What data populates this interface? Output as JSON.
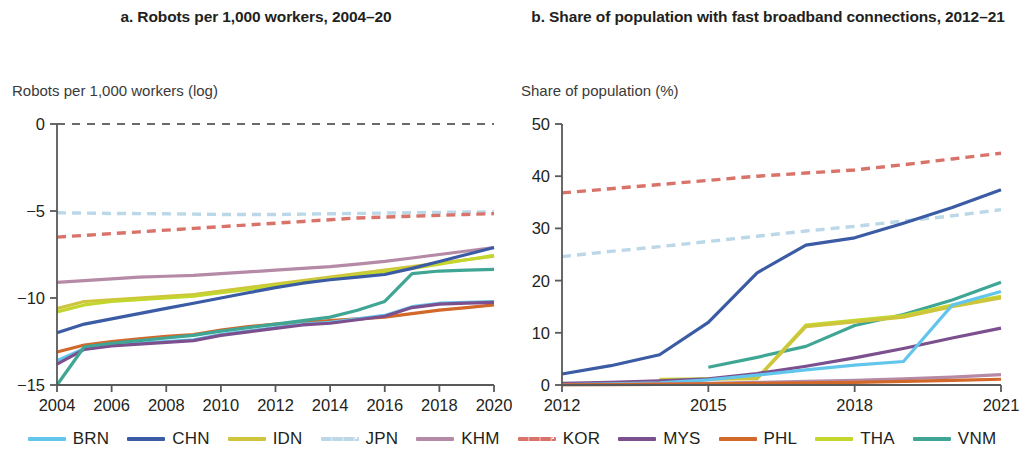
{
  "panels": [
    {
      "id": "a",
      "title": "a. Robots per 1,000 workers, 2004–20",
      "axis_label": "Robots per 1,000 workers (log)"
    },
    {
      "id": "b",
      "title": "b. Share of population with fast broadband connections, 2012–21",
      "axis_label": "Share of population (%)"
    }
  ],
  "legend": {
    "items": [
      {
        "code": "BRN",
        "color": "#62c6ec",
        "dashed": false
      },
      {
        "code": "CHN",
        "color": "#3b5ba5",
        "dashed": false
      },
      {
        "code": "IDN",
        "color": "#cfc53c",
        "dashed": false
      },
      {
        "code": "JPN",
        "color": "#bcd8e8",
        "dashed": true
      },
      {
        "code": "KHM",
        "color": "#b58aa6",
        "dashed": false
      },
      {
        "code": "KOR",
        "color": "#d9736a",
        "dashed": true
      },
      {
        "code": "MYS",
        "color": "#7c4f8e",
        "dashed": false
      },
      {
        "code": "PHL",
        "color": "#d2682a",
        "dashed": false
      },
      {
        "code": "THA",
        "color": "#c3d62e",
        "dashed": false
      },
      {
        "code": "VNM",
        "color": "#3fa695",
        "dashed": false
      }
    ]
  },
  "chart_data": [
    {
      "type": "line",
      "panel": "a",
      "title": "a. Robots per 1,000 workers, 2004–20",
      "xlabel": "",
      "ylabel": "Robots per 1,000 workers (log)",
      "xlim": [
        2004,
        2020
      ],
      "ylim": [
        -15,
        0
      ],
      "ytick_values": [
        0,
        -5,
        -10,
        -15
      ],
      "ytick_labels": [
        "0",
        "−5",
        "−10",
        "−15"
      ],
      "xtick_values": [
        2004,
        2006,
        2008,
        2010,
        2012,
        2014,
        2016,
        2018,
        2020
      ],
      "xtick_labels": [
        "2004",
        "2006",
        "2008",
        "2010",
        "2012",
        "2014",
        "2016",
        "2018",
        "2020"
      ],
      "grid": false,
      "zero_reference_dashed": true,
      "legend_position": "bottom",
      "x": [
        2004,
        2005,
        2006,
        2007,
        2008,
        2009,
        2010,
        2011,
        2012,
        2013,
        2014,
        2015,
        2016,
        2017,
        2018,
        2019,
        2020
      ],
      "series": [
        {
          "name": "JPN",
          "color": "#bcd8e8",
          "dashed": true,
          "values": [
            -5.1,
            -5.12,
            -5.14,
            -5.15,
            -5.16,
            -5.18,
            -5.2,
            -5.2,
            -5.2,
            -5.18,
            -5.16,
            -5.14,
            -5.12,
            -5.1,
            -5.08,
            -5.06,
            -5.05
          ]
        },
        {
          "name": "KOR",
          "color": "#d9736a",
          "dashed": true,
          "values": [
            -6.5,
            -6.4,
            -6.3,
            -6.2,
            -6.1,
            -6.0,
            -5.9,
            -5.8,
            -5.7,
            -5.6,
            -5.5,
            -5.4,
            -5.35,
            -5.3,
            -5.25,
            -5.2,
            -5.15
          ]
        },
        {
          "name": "KHM",
          "color": "#b58aa6",
          "dashed": false,
          "values": [
            -9.1,
            -9.0,
            -8.9,
            -8.8,
            -8.75,
            -8.7,
            -8.6,
            -8.5,
            -8.4,
            -8.3,
            -8.2,
            -8.05,
            -7.9,
            -7.7,
            -7.5,
            -7.3,
            -7.1
          ]
        },
        {
          "name": "IDN",
          "color": "#cfc53c",
          "dashed": false,
          "values": [
            -10.6,
            -10.2,
            -10.1,
            -10.0,
            -9.9,
            -9.8,
            -9.6,
            -9.4,
            -9.2,
            -9.0,
            -8.8,
            -8.6,
            -8.4,
            -8.2,
            -8.0,
            -7.8,
            -7.6
          ]
        },
        {
          "name": "THA",
          "color": "#c3d62e",
          "dashed": false,
          "values": [
            -10.8,
            -10.4,
            -10.2,
            -10.1,
            -10.0,
            -9.9,
            -9.7,
            -9.5,
            -9.3,
            -9.1,
            -8.9,
            -8.7,
            -8.5,
            -8.3,
            -8.05,
            -7.8,
            -7.55
          ]
        },
        {
          "name": "CHN",
          "color": "#3b5ba5",
          "dashed": false,
          "values": [
            -12.0,
            -11.5,
            -11.2,
            -10.9,
            -10.6,
            -10.3,
            -10.0,
            -9.7,
            -9.4,
            -9.15,
            -8.95,
            -8.8,
            -8.65,
            -8.3,
            -7.9,
            -7.5,
            -7.1
          ]
        },
        {
          "name": "PHL",
          "color": "#d2682a",
          "dashed": false,
          "values": [
            -13.1,
            -12.7,
            -12.5,
            -12.35,
            -12.2,
            -12.1,
            -11.85,
            -11.65,
            -11.5,
            -11.4,
            -11.3,
            -11.2,
            -11.1,
            -10.9,
            -10.7,
            -10.55,
            -10.4
          ]
        },
        {
          "name": "BRN",
          "color": "#62c6ec",
          "dashed": false,
          "values": [
            -13.6,
            -12.9,
            -12.7,
            -12.6,
            -12.5,
            -12.4,
            -12.1,
            -11.9,
            -11.7,
            -11.5,
            -11.4,
            -11.2,
            -11.0,
            -10.5,
            -10.3,
            -10.25,
            -10.2
          ]
        },
        {
          "name": "MYS",
          "color": "#7c4f8e",
          "dashed": false,
          "values": [
            -13.8,
            -12.95,
            -12.75,
            -12.65,
            -12.55,
            -12.45,
            -12.15,
            -11.95,
            -11.75,
            -11.55,
            -11.45,
            -11.25,
            -11.05,
            -10.55,
            -10.35,
            -10.3,
            -10.25
          ]
        },
        {
          "name": "VNM",
          "color": "#3fa695",
          "dashed": false,
          "values": [
            -15.0,
            -12.8,
            -12.6,
            -12.45,
            -12.3,
            -12.15,
            -11.9,
            -11.7,
            -11.5,
            -11.3,
            -11.1,
            -10.7,
            -10.2,
            -8.6,
            -8.45,
            -8.4,
            -8.35
          ]
        }
      ]
    },
    {
      "type": "line",
      "panel": "b",
      "title": "b. Share of population with fast broadband connections, 2012–21",
      "xlabel": "",
      "ylabel": "Share of population (%)",
      "xlim": [
        2012,
        2021
      ],
      "ylim": [
        0,
        50
      ],
      "ytick_values": [
        0,
        10,
        20,
        30,
        40,
        50
      ],
      "ytick_labels": [
        "0",
        "10",
        "20",
        "30",
        "40",
        "50"
      ],
      "xtick_values": [
        2012,
        2015,
        2018,
        2021
      ],
      "xtick_labels": [
        "2012",
        "2015",
        "2018",
        "2021"
      ],
      "grid": false,
      "legend_position": "bottom",
      "x": [
        2012,
        2013,
        2014,
        2015,
        2016,
        2017,
        2018,
        2019,
        2020,
        2021
      ],
      "series": [
        {
          "name": "KOR",
          "color": "#d9736a",
          "dashed": true,
          "values": [
            36.8,
            37.6,
            38.4,
            39.2,
            40.0,
            40.6,
            41.2,
            42.2,
            43.3,
            44.4
          ]
        },
        {
          "name": "JPN",
          "color": "#bcd8e8",
          "dashed": true,
          "values": [
            24.6,
            25.6,
            26.5,
            27.5,
            28.5,
            29.5,
            30.4,
            31.4,
            32.4,
            33.6
          ]
        },
        {
          "name": "CHN",
          "color": "#3b5ba5",
          "dashed": false,
          "values": [
            2.1,
            3.7,
            5.8,
            12.0,
            21.5,
            26.8,
            28.2,
            31.0,
            34.0,
            37.4
          ]
        },
        {
          "name": "VNM",
          "color": "#3fa695",
          "dashed": false,
          "values": [
            null,
            null,
            null,
            3.4,
            5.3,
            7.4,
            11.4,
            13.5,
            16.3,
            19.7
          ]
        },
        {
          "name": "THA",
          "color": "#c3d62e",
          "dashed": false,
          "values": [
            null,
            null,
            1.1,
            1.2,
            1.3,
            11.5,
            12.4,
            13.3,
            15.3,
            17.0
          ]
        },
        {
          "name": "IDN",
          "color": "#cfc53c",
          "dashed": false,
          "values": [
            null,
            null,
            1.0,
            1.1,
            1.2,
            11.2,
            12.1,
            13.0,
            15.0,
            16.7
          ]
        },
        {
          "name": "MYS",
          "color": "#7c4f8e",
          "dashed": false,
          "values": [
            0.3,
            0.5,
            0.8,
            1.2,
            2.2,
            3.6,
            5.2,
            7.0,
            9.0,
            10.9
          ]
        },
        {
          "name": "BRN",
          "color": "#62c6ec",
          "dashed": false,
          "values": [
            0.1,
            0.2,
            0.4,
            1.0,
            1.9,
            2.9,
            3.8,
            4.5,
            15.3,
            17.9
          ]
        },
        {
          "name": "KHM",
          "color": "#b58aa6",
          "dashed": false,
          "values": [
            0.05,
            0.1,
            0.2,
            0.3,
            0.5,
            0.7,
            0.9,
            1.2,
            1.5,
            2.0
          ]
        },
        {
          "name": "PHL",
          "color": "#d2682a",
          "dashed": false,
          "values": [
            0.05,
            0.08,
            0.12,
            0.2,
            0.3,
            0.4,
            0.5,
            0.7,
            0.9,
            1.1
          ]
        }
      ]
    }
  ]
}
